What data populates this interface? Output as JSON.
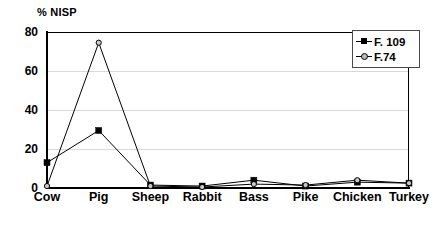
{
  "chart_data": {
    "type": "line",
    "title": "% NISP",
    "xlabel": "",
    "ylabel": "% NISP",
    "ylim": [
      0,
      80
    ],
    "yticks": [
      0,
      20,
      40,
      60,
      80
    ],
    "grid": "horizontal",
    "legend_position": "top-right",
    "categories": [
      "Cow",
      "Pig",
      "Sheep",
      "Rabbit",
      "Bass",
      "Pike",
      "Chicken",
      "Turkey"
    ],
    "series": [
      {
        "name": "F. 109",
        "marker": "filled-square",
        "color": "#000000",
        "values": [
          13,
          29.5,
          1.5,
          1,
          4,
          1,
          3,
          2.5
        ]
      },
      {
        "name": "F.74",
        "marker": "open-circle",
        "color": "#000000",
        "values": [
          1,
          74.5,
          1,
          0.5,
          2,
          1.5,
          4,
          2.5
        ]
      }
    ]
  },
  "legend": {
    "items": [
      {
        "label": "F. 109"
      },
      {
        "label": "F.74"
      }
    ]
  },
  "axis": {
    "title": "% NISP",
    "ytick_labels": [
      "80",
      "60",
      "40",
      "20",
      "0"
    ]
  }
}
